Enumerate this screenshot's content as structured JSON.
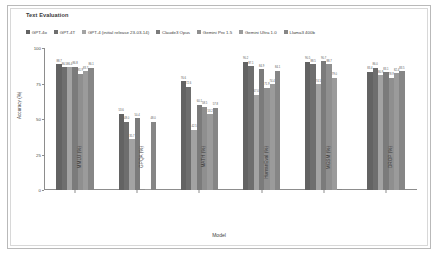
{
  "chart_title": "Text Evaluation",
  "axis": {
    "xlabel": "Model",
    "ylabel": "Accuracy (%)",
    "yticks": [
      "0",
      "25",
      "50",
      "75",
      "100"
    ]
  },
  "legend": [
    {
      "label": "GPT-4o",
      "color": "#636363"
    },
    {
      "label": "GPT-4T",
      "color": "#6e6e6e"
    },
    {
      "label": "GPT-4 (initial release 23-03-14)",
      "color": "#a3a3a3"
    },
    {
      "label": "Claude3 Opus",
      "color": "#7b7b7b"
    },
    {
      "label": "Gemini Pro 1.5",
      "color": "#8f8f8f"
    },
    {
      "label": "Gemini Ultra 1.0",
      "color": "#9b9b9b"
    },
    {
      "label": "Llama3 400b",
      "color": "#868686"
    }
  ],
  "chart_data": {
    "type": "bar",
    "title": "Text Evaluation",
    "xlabel": "Model",
    "ylabel": "Accuracy (%)",
    "ylim": [
      0,
      100
    ],
    "grid": false,
    "legend_position": "top",
    "categories": [
      "MMLU (%)",
      "GPQA (%)",
      "MATH (%)",
      "HumanEval (%)",
      "MGSM (%)",
      "DROP (%)"
    ],
    "series": [
      {
        "name": "GPT-4o",
        "values": [
          88.7,
          53.6,
          76.6,
          90.2,
          90.5,
          83.4
        ]
      },
      {
        "name": "GPT-4T",
        "values": [
          86.5,
          48.0,
          72.6,
          87.1,
          88.5,
          86.0
        ]
      },
      {
        "name": "GPT-4 (initial release 23-03-14)",
        "values": [
          86.4,
          35.7,
          42.5,
          67.0,
          74.5,
          80.9
        ]
      },
      {
        "name": "Claude3 Opus",
        "values": [
          86.8,
          50.4,
          60.1,
          84.9,
          90.7,
          83.1
        ]
      },
      {
        "name": "Gemini Pro 1.5",
        "values": [
          81.9,
          0.0,
          58.5,
          71.9,
          88.7,
          78.9
        ]
      },
      {
        "name": "Gemini Ultra 1.0",
        "values": [
          83.7,
          0.0,
          53.2,
          74.4,
          79.0,
          82.4
        ]
      },
      {
        "name": "Llama3 400b",
        "values": [
          86.1,
          48.0,
          57.8,
          84.1,
          0.0,
          83.5
        ]
      }
    ],
    "bar_value_labels": [
      [
        "88.7",
        "86.5",
        "86.4",
        "86.8",
        "81.9",
        "83.7",
        "86.1"
      ],
      [
        "53.6",
        "48.0",
        "35.7",
        "50.4",
        "",
        "",
        "48.0"
      ],
      [
        "76.6",
        "72.6",
        "42.5",
        "60.1",
        "58.5",
        "53.2",
        "57.8"
      ],
      [
        "90.2",
        "87.1",
        "67.0",
        "84.9",
        "71.9",
        "74.4",
        "84.1"
      ],
      [
        "90.5",
        "88.5",
        "74.5",
        "90.7",
        "88.7",
        "79.0",
        ""
      ],
      [
        "83.4",
        "86.0",
        "80.9",
        "83.1",
        "78.9",
        "82.4",
        "83.5"
      ]
    ]
  }
}
